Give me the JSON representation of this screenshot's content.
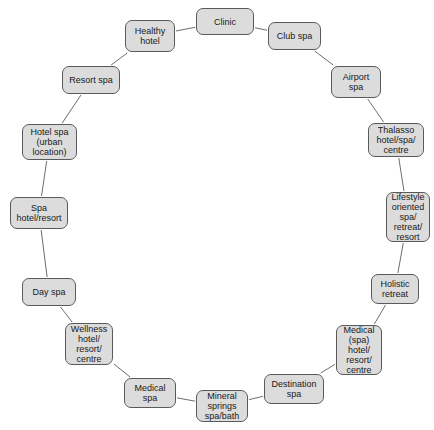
{
  "diagram": {
    "type": "circular-node-diagram",
    "title": "",
    "style": {
      "node_fill": "#dcdcdc",
      "node_border": "#5a5a5a",
      "edge_color": "#6e6e6e",
      "text_color": "#1a1a1a",
      "background": "#ffffff"
    },
    "nodes": [
      {
        "id": "clinic",
        "label": "Clinic",
        "x": 196,
        "y": 8,
        "w": 58,
        "h": 27
      },
      {
        "id": "club-spa",
        "label": "Club spa",
        "x": 268,
        "y": 22,
        "w": 53,
        "h": 28
      },
      {
        "id": "airport-spa",
        "label": "Airport\nspa",
        "x": 331,
        "y": 66,
        "w": 50,
        "h": 32
      },
      {
        "id": "thalasso",
        "label": "Thalasso\nhotel/spa/\ncentre",
        "x": 368,
        "y": 123,
        "w": 56,
        "h": 34
      },
      {
        "id": "lifestyle",
        "label": "Lifestyle\noriented\nspa/\nretreat/\nresort",
        "x": 386,
        "y": 192,
        "w": 44,
        "h": 50
      },
      {
        "id": "holistic",
        "label": "Holistic\nretreat",
        "x": 371,
        "y": 274,
        "w": 48,
        "h": 30
      },
      {
        "id": "medical-hotel",
        "label": "Medical\n(spa)\nhotel/\nresort/\ncentre",
        "x": 336,
        "y": 325,
        "w": 46,
        "h": 50
      },
      {
        "id": "destination",
        "label": "Destination\nspa",
        "x": 264,
        "y": 374,
        "w": 60,
        "h": 30
      },
      {
        "id": "mineral",
        "label": "Mineral\nsprings\nspa/bath",
        "x": 196,
        "y": 390,
        "w": 52,
        "h": 32
      },
      {
        "id": "medical-spa",
        "label": "Medical\nspa",
        "x": 124,
        "y": 378,
        "w": 52,
        "h": 30
      },
      {
        "id": "wellness",
        "label": "Wellness\nhotel/\nresort/\ncentre",
        "x": 65,
        "y": 323,
        "w": 48,
        "h": 42
      },
      {
        "id": "day-spa",
        "label": "Day spa",
        "x": 22,
        "y": 278,
        "w": 54,
        "h": 28
      },
      {
        "id": "spa-hotel",
        "label": "Spa\nhotel/resort",
        "x": 10,
        "y": 197,
        "w": 58,
        "h": 32
      },
      {
        "id": "hotel-spa",
        "label": "Hotel spa\n(urban\nlocation)",
        "x": 22,
        "y": 124,
        "w": 55,
        "h": 36
      },
      {
        "id": "resort-spa",
        "label": "Resort spa",
        "x": 62,
        "y": 66,
        "w": 58,
        "h": 28
      },
      {
        "id": "healthy-hotel",
        "label": "Healthy\nhotel",
        "x": 125,
        "y": 20,
        "w": 50,
        "h": 32
      }
    ],
    "edges": [
      {
        "from": "clinic",
        "to": "club-spa"
      },
      {
        "from": "club-spa",
        "to": "airport-spa"
      },
      {
        "from": "airport-spa",
        "to": "thalasso"
      },
      {
        "from": "thalasso",
        "to": "lifestyle"
      },
      {
        "from": "lifestyle",
        "to": "holistic"
      },
      {
        "from": "holistic",
        "to": "medical-hotel"
      },
      {
        "from": "medical-hotel",
        "to": "destination"
      },
      {
        "from": "destination",
        "to": "mineral"
      },
      {
        "from": "mineral",
        "to": "medical-spa"
      },
      {
        "from": "medical-spa",
        "to": "wellness"
      },
      {
        "from": "wellness",
        "to": "day-spa"
      },
      {
        "from": "day-spa",
        "to": "spa-hotel"
      },
      {
        "from": "spa-hotel",
        "to": "hotel-spa"
      },
      {
        "from": "hotel-spa",
        "to": "resort-spa"
      },
      {
        "from": "resort-spa",
        "to": "healthy-hotel"
      },
      {
        "from": "healthy-hotel",
        "to": "clinic"
      }
    ]
  }
}
